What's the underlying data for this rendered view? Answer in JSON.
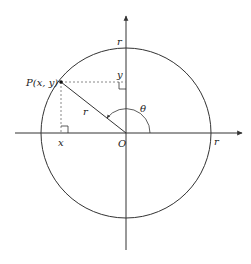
{
  "diagram": {
    "type": "unit-circle-polar",
    "labels": {
      "point": "P(x, y)",
      "x_foot": "x",
      "y_foot": "y",
      "origin": "O",
      "radius_segment": "r",
      "radius_top": "r",
      "radius_right": "r",
      "angle": "θ"
    },
    "colors": {
      "stroke": "#333333",
      "dashed": "#888888",
      "background": "#ffffff"
    }
  }
}
